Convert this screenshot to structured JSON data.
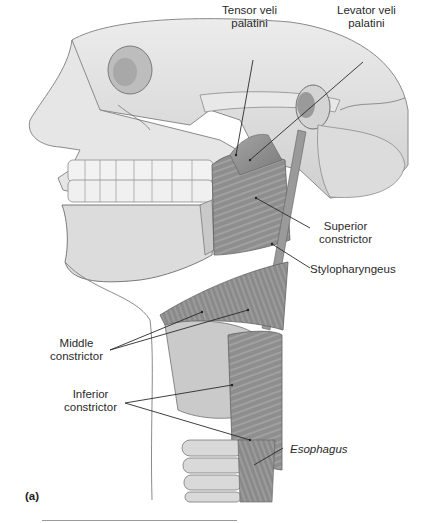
{
  "figure": {
    "panel_label": "(a)",
    "colors": {
      "background": "#ffffff",
      "bone": "#e2e2e2",
      "bone_shadow": "#b8b8b8",
      "muscle": "#8f8f8f",
      "muscle_dark": "#6e6e6e",
      "cartilage": "#cfcfcf",
      "leader_line": "#2a2a2a",
      "label_text": "#2a2a2a"
    },
    "labels": [
      {
        "id": "tensor-veli-palatini",
        "text": "Tensor veli\npalatini",
        "italic": false
      },
      {
        "id": "levator-veli-palatini",
        "text": "Levator veli\npalatini",
        "italic": false
      },
      {
        "id": "superior-constrictor",
        "text": "Superior\nconstrictor",
        "italic": false
      },
      {
        "id": "stylopharyngeus",
        "text": "Stylopharyngeus",
        "italic": false
      },
      {
        "id": "middle-constrictor",
        "text": "Middle\nconstrictor",
        "italic": false
      },
      {
        "id": "inferior-constrictor",
        "text": "Inferior\nconstrictor",
        "italic": false
      },
      {
        "id": "esophagus",
        "text": "Esophagus",
        "italic": true
      }
    ]
  }
}
